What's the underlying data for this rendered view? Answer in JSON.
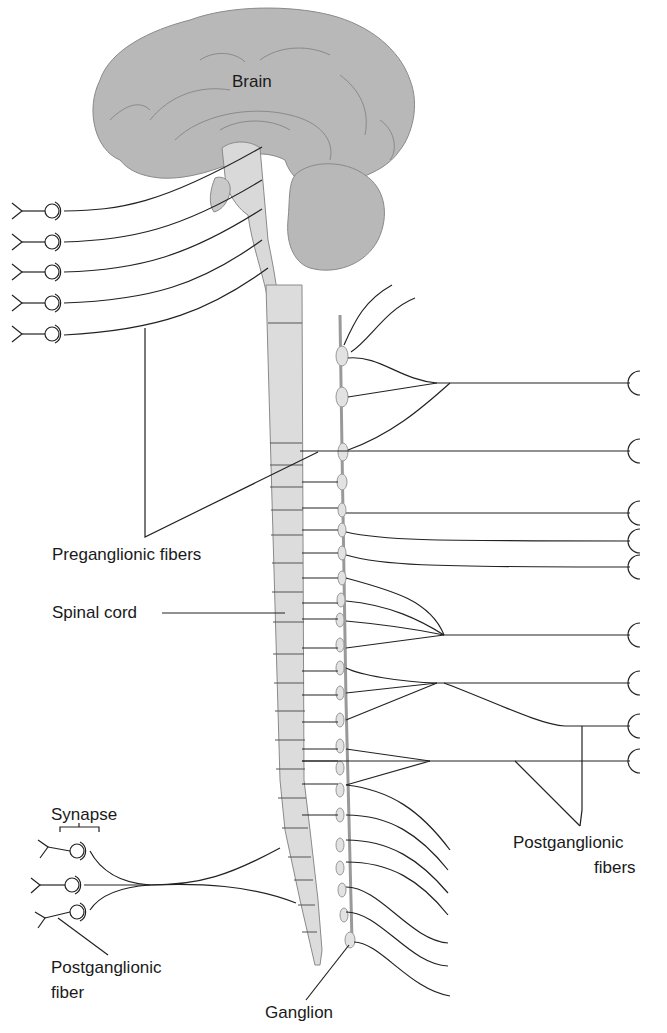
{
  "diagram": {
    "labels": {
      "brain": "Brain",
      "preganglionic": "Preganglionic fibers",
      "spinal_cord": "Spinal cord",
      "synapse": "Synapse",
      "postganglionic_fiber_line1": "Postganglionic",
      "postganglionic_fiber_line2": "fiber",
      "postganglionic_fibers_line1": "Postganglionic",
      "postganglionic_fibers_line2": "fibers",
      "ganglion": "Ganglion"
    },
    "colors": {
      "brain_fill": "#b8b8b8",
      "brainstem_fill": "#d9d9d9",
      "cord_fill": "#dcdcdc",
      "ganglion_fill": "#e2e2e2",
      "line": "#222222"
    },
    "counts": {
      "cranial_outputs": 5,
      "sacral_outputs": 3,
      "right_targets": 9,
      "chain_ganglia": 23
    }
  }
}
